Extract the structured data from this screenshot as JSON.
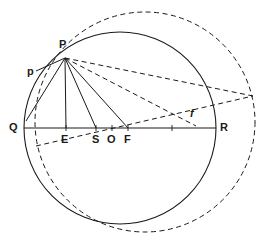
{
  "figure": {
    "type": "geometric-construction",
    "title": "",
    "background_color": "#ffffff",
    "stroke_color": "#1a1a1a",
    "width": 270,
    "height": 237
  },
  "labels": {
    "P": "P",
    "p": "p",
    "Q": "Q",
    "E": "E",
    "S": "S",
    "O": "O",
    "F": "F",
    "R": "R",
    "f": "f"
  },
  "points": [
    {
      "id": "P",
      "label": "P",
      "x": 65,
      "y": 58,
      "label_x": 59,
      "label_y": 39,
      "style": "upright"
    },
    {
      "id": "p",
      "label": "p",
      "x": 38,
      "y": 72,
      "label_x": 27,
      "label_y": 66,
      "style": "upright"
    },
    {
      "id": "Q",
      "label": "Q",
      "x": 24,
      "y": 128,
      "label_x": 10,
      "label_y": 122,
      "style": "upright"
    },
    {
      "id": "E",
      "label": "E",
      "x": 66,
      "y": 128,
      "label_x": 61,
      "label_y": 133,
      "style": "upright"
    },
    {
      "id": "S",
      "label": "S",
      "x": 96,
      "y": 128,
      "label_x": 91,
      "label_y": 133,
      "style": "upright"
    },
    {
      "id": "O",
      "label": "O",
      "x": 112,
      "y": 128,
      "label_x": 107,
      "label_y": 133,
      "style": "upright"
    },
    {
      "id": "F",
      "label": "F",
      "x": 128,
      "y": 128,
      "label_x": 123,
      "label_y": 133,
      "style": "upright"
    },
    {
      "id": "R",
      "label": "R",
      "x": 216,
      "y": 128,
      "label_x": 220,
      "label_y": 122,
      "style": "upright"
    },
    {
      "id": "f",
      "label": "f",
      "x": 194,
      "y": 124,
      "label_x": 190,
      "label_y": 108,
      "style": "italic"
    }
  ],
  "circles": [
    {
      "id": "solid-circle",
      "name": "main-circle",
      "cx": 120,
      "cy": 128,
      "r": 96,
      "stroke": "#1a1a1a",
      "stroke_width": 1.1,
      "dashed": false
    },
    {
      "id": "dashed-circle",
      "name": "eccentric-circle",
      "cx": 145,
      "cy": 122,
      "r": 110,
      "stroke": "#1a1a1a",
      "stroke_width": 1.0,
      "dashed": true,
      "dash_pattern": "5,3.5"
    }
  ],
  "segments": [
    {
      "id": "diameter-QR",
      "name": "diameter-line",
      "x1": 24,
      "y1": 128,
      "x2": 216,
      "y2": 128,
      "dashed": false
    },
    {
      "id": "PQ-chord",
      "name": "chord-p-to-q",
      "x1": 65,
      "y1": 58,
      "x2": 27,
      "y2": 122,
      "dashed": false
    },
    {
      "id": "P-tangent-p",
      "name": "tangent-at-p",
      "x1": 65,
      "y1": 58,
      "x2": 36,
      "y2": 71,
      "dashed": false
    },
    {
      "id": "PE-line",
      "name": "line-p-to-e",
      "x1": 65,
      "y1": 58,
      "x2": 66,
      "y2": 128,
      "dashed": false
    },
    {
      "id": "PS-line",
      "name": "line-p-to-s",
      "x1": 65,
      "y1": 58,
      "x2": 96,
      "y2": 128,
      "dashed": false
    },
    {
      "id": "PF-line",
      "name": "line-p-to-f",
      "x1": 65,
      "y1": 58,
      "x2": 128,
      "y2": 128,
      "dashed": false
    },
    {
      "id": "Pf-dashed",
      "name": "dashed-line-p-to-f-point",
      "x1": 65,
      "y1": 58,
      "x2": 196,
      "y2": 126,
      "dashed": true
    },
    {
      "id": "P-long-dashed",
      "name": "dashed-chord-from-p",
      "x1": 65,
      "y1": 58,
      "x2": 253,
      "y2": 96,
      "dashed": true
    },
    {
      "id": "lower-dashed-chord",
      "name": "dashed-chord-through-e",
      "x1": 36,
      "y1": 146,
      "x2": 253,
      "y2": 96,
      "dashed": true
    }
  ],
  "ticks": [
    {
      "id": "tick-E",
      "x": 66,
      "y": 128
    },
    {
      "id": "tick-S",
      "x": 96,
      "y": 128
    },
    {
      "id": "tick-O",
      "x": 112,
      "y": 128
    },
    {
      "id": "tick-F",
      "x": 128,
      "y": 128
    },
    {
      "id": "tick-mid",
      "x": 172,
      "y": 128
    }
  ]
}
